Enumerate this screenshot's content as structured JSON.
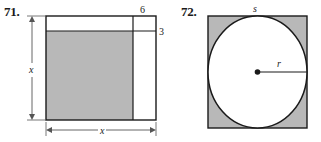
{
  "page": {
    "width": 321,
    "height": 142,
    "background": "#ffffff"
  },
  "style": {
    "fill_gray": "#b8b8b8",
    "fill_white": "#ffffff",
    "stroke": "#1a1a1a",
    "text_color": "#1a1a1a"
  },
  "problems": [
    {
      "id": "71",
      "number_label": "71.",
      "figure_type": "rectangle-with-border-strips",
      "description": "Large rectangle of side x with a 6-unit wide white column on the right and a 3-unit tall white strip across the top; remaining interior is shaded gray.",
      "labels": {
        "top_strip_width": "6",
        "right_strip_width": "3",
        "vertical_dimension": "x",
        "horizontal_dimension": "x"
      },
      "geometry": {
        "outer_left": 46,
        "outer_top": 16,
        "outer_right": 156,
        "outer_bottom": 120,
        "inner_divider_x": 133,
        "inner_divider_y": 31,
        "shade_left": 46,
        "shade_top": 31,
        "shade_right": 133,
        "shade_bottom": 120
      }
    },
    {
      "id": "72",
      "number_label": "72.",
      "figure_type": "circle-inscribed-in-square",
      "description": "A circle of radius r inscribed in a square of side s; the four corner regions outside the circle are shaded gray.",
      "labels": {
        "square_side": "s",
        "radius": "r"
      },
      "geometry": {
        "square_left": 208,
        "square_top": 16,
        "square_right": 307,
        "square_bottom": 128,
        "circle_cx": 257.5,
        "circle_cy": 72,
        "circle_r": 49.5,
        "center_dot_r": 2.6
      }
    }
  ]
}
